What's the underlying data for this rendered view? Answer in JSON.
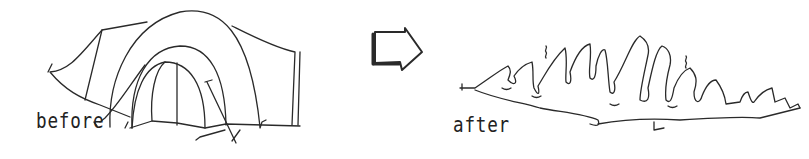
{
  "illustration": {
    "before_label": "before",
    "after_label": "after",
    "stroke_color": "#2a2a2a",
    "background": "#ffffff"
  }
}
